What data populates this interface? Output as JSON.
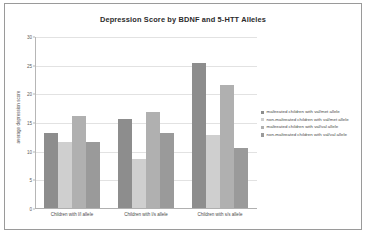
{
  "chart_data": {
    "type": "bar",
    "title": "Depression Score by BDNF and 5-HTT Alleles",
    "xlabel": "",
    "ylabel": "average depression score",
    "ylim": [
      0,
      30
    ],
    "ytick_values": [
      0,
      5,
      10,
      15,
      20,
      25,
      30
    ],
    "ytick_labels": [
      "0",
      "5",
      "10",
      "15",
      "20",
      "25",
      "30"
    ],
    "grid": true,
    "legend_position": "right",
    "categories": [
      "Children with l/l allele",
      "Children with l/s allele",
      "Children with s/s allele"
    ],
    "series": [
      {
        "name": "maltreated children with val/met allele",
        "color": "#8d8d8d",
        "values": [
          13.0,
          15.5,
          25.3
        ]
      },
      {
        "name": "non-maltreated children with val/met allele",
        "color": "#cfcfcf",
        "values": [
          11.5,
          8.5,
          12.8
        ]
      },
      {
        "name": "maltreated children with val/val allele",
        "color": "#b0b0b0",
        "values": [
          16.0,
          16.7,
          21.5
        ]
      },
      {
        "name": "non-maltreated children with val/val allele",
        "color": "#9a9a9a",
        "values": [
          11.5,
          13.0,
          10.5
        ]
      }
    ]
  }
}
